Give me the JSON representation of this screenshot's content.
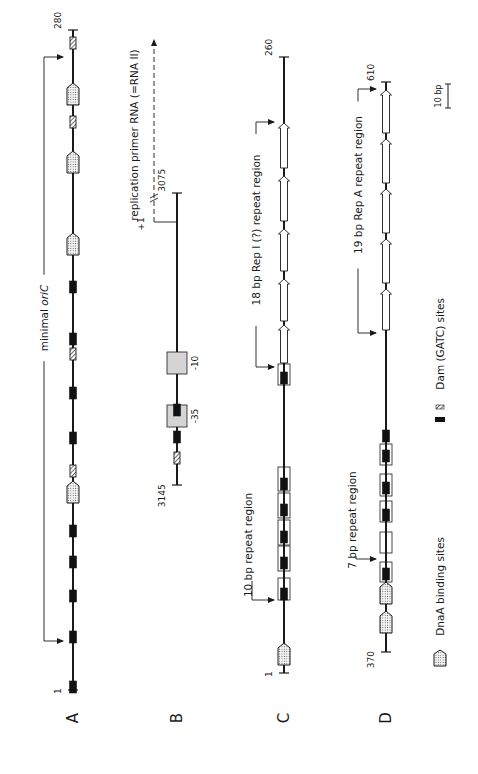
{
  "figure": {
    "colors": {
      "ink": "#1a1a1a",
      "dam_fill": "#111111",
      "promoter_box_fill": "#d4d4d4",
      "dnaA_fill": "#f4f4f4",
      "repeat_box_fill": "#ffffff"
    },
    "panels": [
      {
        "id": "A",
        "letter": "A",
        "line_x": 73,
        "y_top": 30,
        "y_bottom": 690,
        "top_coord": "280",
        "bottom_coord": "1",
        "features": [
          {
            "type": "hatched",
            "y": 43
          },
          {
            "type": "dnaA",
            "y": 94
          },
          {
            "type": "hatched",
            "y": 122
          },
          {
            "type": "dnaA",
            "y": 162
          },
          {
            "type": "dnaA",
            "y": 244
          },
          {
            "type": "dam",
            "y": 287
          },
          {
            "type": "dam",
            "y": 339
          },
          {
            "type": "hatched",
            "y": 354
          },
          {
            "type": "dam",
            "y": 393
          },
          {
            "type": "dam",
            "y": 438
          },
          {
            "type": "hatched",
            "y": 471
          },
          {
            "type": "dnaA",
            "y": 492
          },
          {
            "type": "dam",
            "y": 531
          },
          {
            "type": "dam",
            "y": 562
          },
          {
            "type": "dam",
            "y": 596
          },
          {
            "type": "dam",
            "y": 637
          },
          {
            "type": "dam",
            "y": 687
          }
        ],
        "region_brackets": [
          {
            "label": "minimal oriC",
            "label_main": "minimal ",
            "label_italic": "ori",
            "label_tail": "C",
            "x": 44,
            "y_start": 57,
            "y_end": 641,
            "label_y": 318
          }
        ]
      },
      {
        "id": "B",
        "letter": "B",
        "line_x": 177,
        "y_top": 193,
        "y_bottom": 485,
        "top_coord": "3075",
        "bottom_coord": "3145",
        "features": [
          {
            "type": "promoter",
            "y": 363,
            "label": "-10"
          },
          {
            "type": "promoter",
            "y": 416,
            "label": "-35"
          },
          {
            "type": "dam",
            "y": 410
          },
          {
            "type": "dam",
            "y": 437
          },
          {
            "type": "hatched",
            "y": 458
          }
        ],
        "transcript": {
          "label": "replication primer RNA (=RNA II)",
          "start_label": "+1",
          "start_y": 222,
          "x": 154,
          "arrow_end_y": 40,
          "break_y": 195
        }
      },
      {
        "id": "C",
        "letter": "C",
        "line_x": 284,
        "y_top": 57,
        "y_bottom": 673,
        "top_coord": "260",
        "bottom_coord": "1",
        "features": [
          {
            "type": "repeat_arrow",
            "y1": 123,
            "y2": 168
          },
          {
            "type": "repeat_arrow",
            "y1": 176,
            "y2": 221
          },
          {
            "type": "repeat_arrow",
            "y1": 229,
            "y2": 271
          },
          {
            "type": "repeat_arrow",
            "y1": 279,
            "y2": 321
          },
          {
            "type": "repeat_arrow",
            "y1": 325,
            "y2": 363
          },
          {
            "type": "repeat_box",
            "y1": 364,
            "y2": 385
          },
          {
            "type": "dam",
            "y": 378
          },
          {
            "type": "repeat_box",
            "y1": 467,
            "y2": 491
          },
          {
            "type": "dam",
            "y": 484
          },
          {
            "type": "repeat_box",
            "y1": 493,
            "y2": 518
          },
          {
            "type": "dam",
            "y": 510
          },
          {
            "type": "repeat_box",
            "y1": 520,
            "y2": 545
          },
          {
            "type": "dam",
            "y": 537
          },
          {
            "type": "repeat_box",
            "y1": 546,
            "y2": 571
          },
          {
            "type": "dam",
            "y": 563
          },
          {
            "type": "repeat_box",
            "y1": 578,
            "y2": 600
          },
          {
            "type": "dam",
            "y": 594
          },
          {
            "type": "dnaA",
            "y": 654
          }
        ],
        "region_brackets": [
          {
            "label": "18 bp Rep I (?) repeat region",
            "x": 256,
            "y_start": 122,
            "y_end": 367,
            "label_y": 230
          },
          {
            "label": "10 bp repeat region",
            "x": 252,
            "y_start": 586,
            "y_end": 597,
            "label_y": 545,
            "short": true,
            "arrow_y": 600
          }
        ]
      },
      {
        "id": "D",
        "letter": "D",
        "line_x": 386,
        "y_top": 82,
        "y_bottom": 652,
        "top_coord": "610",
        "bottom_coord": "370",
        "features": [
          {
            "type": "repeat_arrow",
            "y1": 90,
            "y2": 133
          },
          {
            "type": "repeat_arrow",
            "y1": 139,
            "y2": 183
          },
          {
            "type": "repeat_arrow",
            "y1": 189,
            "y2": 233
          },
          {
            "type": "repeat_arrow",
            "y1": 239,
            "y2": 283
          },
          {
            "type": "repeat_arrow",
            "y1": 289,
            "y2": 330
          },
          {
            "type": "dam",
            "y": 436
          },
          {
            "type": "repeat_box",
            "y1": 444,
            "y2": 465
          },
          {
            "type": "dam",
            "y": 456
          },
          {
            "type": "repeat_box",
            "y1": 474,
            "y2": 496
          },
          {
            "type": "dam",
            "y": 488
          },
          {
            "type": "repeat_box",
            "y1": 501,
            "y2": 522
          },
          {
            "type": "dam",
            "y": 515
          },
          {
            "type": "repeat_box",
            "y1": 532,
            "y2": 553
          },
          {
            "type": "repeat_box",
            "y1": 562,
            "y2": 582
          },
          {
            "type": "dam",
            "y": 574
          },
          {
            "type": "dnaA",
            "y": 593
          },
          {
            "type": "dnaA",
            "y": 622
          }
        ],
        "region_brackets": [
          {
            "label": "19 bp Rep A repeat region",
            "x": 358,
            "y_start": 89,
            "y_end": 333,
            "label_y": 185
          },
          {
            "label": "7 bp repeat region",
            "x": 356,
            "y_start": 570,
            "y_end": 559,
            "label_y": 520,
            "short": true,
            "arrow_y": 559
          }
        ]
      }
    ],
    "scale_bar": {
      "label": "10 bp",
      "x": 448,
      "y_top": 84,
      "y_bottom": 108
    },
    "legend": {
      "items": [
        {
          "icon": "dnaA-binding-site-icon",
          "label": "DnaA binding sites",
          "y": 658
        },
        {
          "icon": "dam-site-icon",
          "label": "Dam (GATC) sites",
          "y": 403
        }
      ]
    }
  }
}
